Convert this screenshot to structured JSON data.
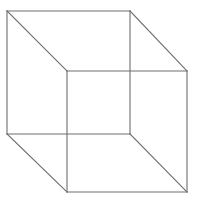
{
  "figure": {
    "background_color": "#ffffff",
    "line_color": "#6e6e6e",
    "line_width": 1.1,
    "canvas": {
      "width": 199,
      "height": 203
    }
  },
  "chart_data": {
    "type": "diagram",
    "shape": "wireframe-cube",
    "vertices": [
      {
        "id": "back-top-left",
        "x": 7,
        "y": 11
      },
      {
        "id": "back-top-right",
        "x": 130,
        "y": 11
      },
      {
        "id": "back-bottom-right",
        "x": 130,
        "y": 134
      },
      {
        "id": "back-bottom-left",
        "x": 7,
        "y": 134
      },
      {
        "id": "front-top-left",
        "x": 67,
        "y": 71
      },
      {
        "id": "front-top-right",
        "x": 187,
        "y": 71
      },
      {
        "id": "front-bottom-right",
        "x": 187,
        "y": 192
      },
      {
        "id": "front-bottom-left",
        "x": 67,
        "y": 192
      }
    ],
    "faces": {
      "back_square": "7,11 130,11 130,134 7,134",
      "front_square": "67,71 187,71 187,192 67,192"
    },
    "edges": [
      {
        "id": "back-top",
        "from": "back-top-left",
        "to": "back-top-right"
      },
      {
        "id": "back-right",
        "from": "back-top-right",
        "to": "back-bottom-right"
      },
      {
        "id": "back-bottom",
        "from": "back-bottom-right",
        "to": "back-bottom-left"
      },
      {
        "id": "back-left",
        "from": "back-bottom-left",
        "to": "back-top-left"
      },
      {
        "id": "front-top",
        "from": "front-top-left",
        "to": "front-top-right"
      },
      {
        "id": "front-right",
        "from": "front-top-right",
        "to": "front-bottom-right"
      },
      {
        "id": "front-bottom",
        "from": "front-bottom-right",
        "to": "front-bottom-left"
      },
      {
        "id": "front-left",
        "from": "front-bottom-left",
        "to": "front-top-left"
      },
      {
        "id": "connector-top-left",
        "from": "back-top-left",
        "to": "front-top-left"
      },
      {
        "id": "connector-top-right",
        "from": "back-top-right",
        "to": "front-top-right"
      },
      {
        "id": "connector-bottom-right",
        "from": "back-bottom-right",
        "to": "front-bottom-right"
      },
      {
        "id": "connector-bottom-left",
        "from": "back-bottom-left",
        "to": "front-bottom-left"
      }
    ],
    "edge_paths": {
      "back_top": "M 7 11 L 130 11",
      "back_right": "M 130 11 L 130 134",
      "back_bottom": "M 130 134 L 7 134",
      "back_left": "M 7 134 L 7 11",
      "front_top": "M 67 71 L 187 71",
      "front_right": "M 187 71 L 187 192",
      "front_bottom": "M 187 192 L 67 192",
      "front_left": "M 67 192 L 67 71",
      "connector_top_left": "M 7 11 L 67 71",
      "connector_top_right": "M 130 11 L 187 71",
      "connector_bottom_right": "M 130 134 L 187 192",
      "connector_bottom_left": "M 7 134 L 67 192"
    },
    "grid": false,
    "legend": null,
    "xlabel": "",
    "ylabel": "",
    "annotations": []
  }
}
